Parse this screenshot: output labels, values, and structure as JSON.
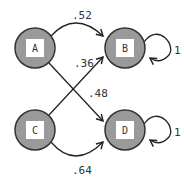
{
  "diagram": {
    "type": "markov-chain",
    "colors": {
      "node_fill": "#9a9a9a",
      "node_stroke": "#333333",
      "label_box": "#ffffff",
      "edge": "#222222",
      "text": "#333333"
    },
    "nodes": [
      {
        "id": "A",
        "label": "A",
        "cx": 35,
        "cy": 48
      },
      {
        "id": "B",
        "label": "B",
        "cx": 125,
        "cy": 48
      },
      {
        "id": "C",
        "label": "C",
        "cx": 35,
        "cy": 130
      },
      {
        "id": "D",
        "label": "D",
        "cx": 125,
        "cy": 130
      }
    ],
    "edges": [
      {
        "from": "A",
        "to": "B",
        "weight": ".52"
      },
      {
        "from": "C",
        "to": "B",
        "weight": ".36"
      },
      {
        "from": "A",
        "to": "D",
        "weight": ".48"
      },
      {
        "from": "C",
        "to": "D",
        "weight": ".64"
      },
      {
        "from": "B",
        "to": "B",
        "weight": "1"
      },
      {
        "from": "D",
        "to": "D",
        "weight": "1"
      }
    ]
  }
}
